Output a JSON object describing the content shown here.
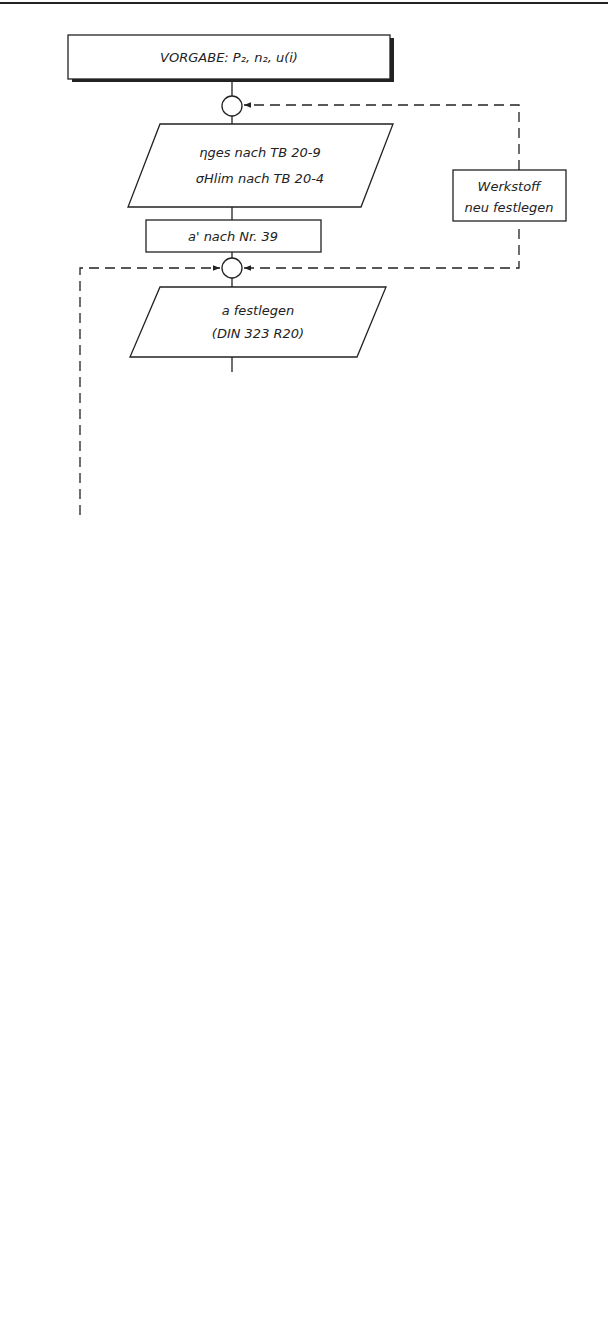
{
  "diagram": {
    "type": "flowchart",
    "start": {
      "text": "VORGABE:  P₂, n₂, u(i)"
    },
    "steps": {
      "eta_sigma_line1": "ηges nach TB 20-9",
      "eta_sigma_line2": "σHlim nach TB 20-4",
      "a_prime": "a' nach Nr. 39",
      "a_fest_line1": "a festlegen",
      "a_fest_line2": "(DIN 323 R20)",
      "z1_line1": "z₁ nach Nr. 35",
      "z1_line2": "oder Wahl nach TB 23-3",
      "z2": "z₂ = u · z₁",
      "i_ist": "iᵢₛₜ = z₂ / z₁",
      "psi_a": "ψa siehe zu Nr. 36",
      "dm1": "d'm1 = ψa · a",
      "d2": "d'₂ nach Nr. 37",
      "m_prime": "m' = d'₂ / z₂",
      "m_fest": "m festlegen nach TB 23-4",
      "schnecke_line1": "Abmessungen der Schnecke",
      "schnecke_line2": "nach Nr. 18ff",
      "rad_line1": "Abmessungen des",
      "rad_line2": "Schneckenrades nach Nr. 23ff"
    },
    "decisions": {
      "d1_line1": "i",
      "d1_line2": "zufriedenstellend",
      "d1_line3": "?",
      "d2_line1": "Ergebnisse",
      "d2_line2": "zufriedenstellend",
      "d2_line3": "?"
    },
    "side_boxes": {
      "werkstoff_line1": "Werkstoff",
      "werkstoff_line2": "neu festlegen",
      "z1_neu_line1": "z₁",
      "z1_neu_line2": "neu wählen",
      "wiederholung_line1": "Wiederholung",
      "wiederholung_line2": "mit anderen",
      "wiederholung_line3": "Eingabegrößen"
    },
    "branch_labels": {
      "d1_no": "N",
      "d1_yes": "J",
      "d2_no": "N",
      "d2_yes": "J"
    },
    "end": {
      "text": "Ende"
    }
  }
}
